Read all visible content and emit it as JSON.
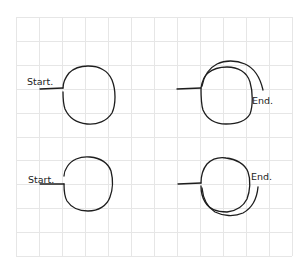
{
  "diagram": {
    "background_color": "#ffffff",
    "grid": {
      "color": "#e6e6e6",
      "x0": 16,
      "y0": 17,
      "columns": 12,
      "rows": 10,
      "cell_width": 23,
      "cell_height": 23.9
    },
    "stroke_color": "#1e1e1e",
    "figures": [
      {
        "id": "top-left",
        "label": "Start.",
        "label_role": "start",
        "description": "single loop starting upward from lead-in line"
      },
      {
        "id": "top-right",
        "label": "End.",
        "label_role": "end",
        "description": "loop with overlapping outer arc over the top ending at right"
      },
      {
        "id": "bottom-left",
        "label": "Start.",
        "label_role": "start",
        "description": "single loop starting downward from lead-in line"
      },
      {
        "id": "bottom-right",
        "label": "End.",
        "label_role": "end",
        "description": "loop with overlapping outer arc under the bottom ending at right"
      }
    ]
  }
}
